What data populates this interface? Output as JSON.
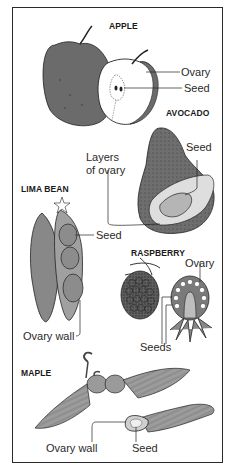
{
  "diagram": {
    "sections": [
      {
        "name": "APPLE",
        "labels": [
          "Ovary",
          "Seed"
        ]
      },
      {
        "name": "AVOCADO",
        "labels": [
          "Seed",
          "Layers of ovary"
        ]
      },
      {
        "name": "LIMA BEAN",
        "labels": [
          "Seed",
          "Ovary wall"
        ]
      },
      {
        "name": "RASPBERRY",
        "labels": [
          "Ovary",
          "Seeds"
        ]
      },
      {
        "name": "MAPLE",
        "labels": [
          "Ovary wall",
          "Seed"
        ]
      }
    ]
  },
  "apple": {
    "title": "APPLE",
    "ovary": "Ovary",
    "seed": "Seed"
  },
  "avocado": {
    "title": "AVOCADO",
    "seed": "Seed",
    "layers_line1": "Layers",
    "layers_line2": "of ovary"
  },
  "lima_bean": {
    "title": "LIMA BEAN",
    "seed": "Seed",
    "ovary_wall": "Ovary wall"
  },
  "raspberry": {
    "title": "RASPBERRY",
    "ovary": "Ovary",
    "seeds": "Seeds"
  },
  "maple": {
    "title": "MAPLE",
    "ovary_wall": "Ovary wall",
    "seed": "Seed"
  },
  "colors": {
    "frame": "#2a2a2a",
    "dark_fill": "#6b6b6b",
    "mid_fill": "#9a9a9a",
    "light_fill": "#cfcfcf",
    "background": "#ffffff"
  }
}
